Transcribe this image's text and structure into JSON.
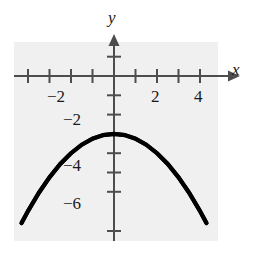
{
  "chart_data": {
    "type": "line",
    "title": "",
    "xlabel": "x",
    "ylabel": "y",
    "equation": "y = -0.25x^2 - 3",
    "vertex": [
      0,
      -3
    ],
    "xlim": [
      -4.6,
      4.6
    ],
    "ylim": [
      -7.6,
      1.7
    ],
    "grid": false,
    "legend": null,
    "background": "#f0f0f0",
    "curve_color": "#000000",
    "axis_color": "#4d4d4d",
    "x_axis": {
      "tick_values": [
        -4,
        -3,
        -2,
        -1,
        1,
        2,
        3,
        4
      ],
      "labeled_ticks": [
        {
          "value": -2,
          "label": "−2"
        },
        {
          "value": 2,
          "label": "2"
        },
        {
          "value": 4,
          "label": "4"
        }
      ],
      "arrow": "right",
      "name": "x"
    },
    "y_axis": {
      "tick_values": [
        1,
        -1,
        -2,
        -3,
        -4,
        -5,
        -6,
        -7
      ],
      "labeled_ticks": [
        {
          "value": -2,
          "label": "−2"
        },
        {
          "value": -4,
          "label": "−4"
        },
        {
          "value": -6,
          "label": "−6"
        }
      ],
      "arrow": "up",
      "name": "y"
    },
    "series": [
      {
        "name": "parabola",
        "x": [
          -4.3,
          -4.0,
          -3.5,
          -3.0,
          -2.5,
          -2.0,
          -1.5,
          -1.0,
          -0.5,
          0.0,
          0.5,
          1.0,
          1.5,
          2.0,
          2.5,
          3.0,
          3.5,
          4.0,
          4.3
        ],
        "y": [
          -7.62,
          -7.0,
          -6.06,
          -5.25,
          -4.56,
          -4.0,
          -3.56,
          -3.25,
          -3.06,
          -3.0,
          -3.06,
          -3.25,
          -3.56,
          -4.0,
          -4.56,
          -5.25,
          -6.06,
          -7.0,
          -7.62
        ]
      }
    ]
  },
  "labels": {
    "x_axis_name": "x",
    "y_axis_name": "y",
    "x_neg2": "−2",
    "x_2": "2",
    "x_4": "4",
    "y_neg2": "−2",
    "y_neg4": "−4",
    "y_neg6": "−6"
  }
}
